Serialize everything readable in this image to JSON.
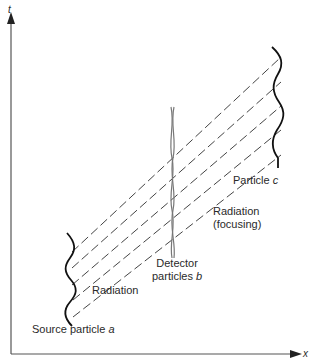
{
  "diagram": {
    "axes": {
      "x_label": "x",
      "y_label": "t"
    },
    "labels": {
      "source": {
        "text": "Source particle ",
        "var": "a"
      },
      "radiation": "Radiation",
      "detector_line1": "Detector",
      "detector_line2": "particles ",
      "detector_var": "b",
      "focusing_line1": "Radiation",
      "focusing_line2": "(focusing)",
      "particle_c": "Particle ",
      "particle_c_var": "c"
    },
    "colors": {
      "line": "#1a1a1a",
      "axis": "#555555",
      "dash": "#444444",
      "detector": "#777777"
    },
    "radiation_line_count": 5
  }
}
